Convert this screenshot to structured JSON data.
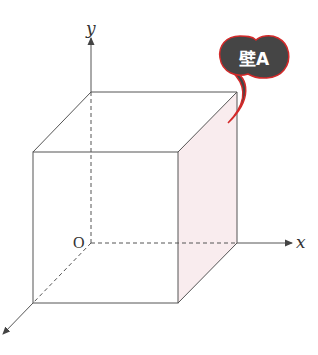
{
  "diagram": {
    "type": "3d-cube-coordinate-system",
    "axes": {
      "x_label": "x",
      "y_label": "y",
      "origin_label": "O"
    },
    "callout": {
      "text": "壁A",
      "fill": "#454545",
      "outline": "#d42a2a",
      "points_to": "right-face"
    },
    "colors": {
      "line": "#555555",
      "highlight_face": "#f9ecee"
    }
  }
}
